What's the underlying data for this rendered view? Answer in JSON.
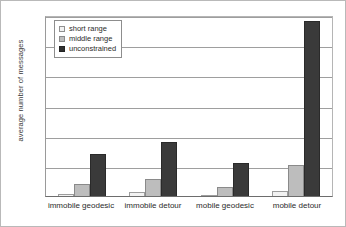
{
  "chart_data": {
    "type": "bar",
    "title": "",
    "xlabel": "",
    "ylabel": "average number of messages",
    "ylim": [
      0,
      3000
    ],
    "yticks": [
      "0",
      "500",
      "1000",
      "1500",
      "2000",
      "2500",
      "3000"
    ],
    "grid": true,
    "legend_position": "top-left",
    "categories": [
      "immobile geodesic",
      "immobile detour",
      "mobile geodesic",
      "mobile detour"
    ],
    "series": [
      {
        "name": "short range",
        "values": [
          30,
          60,
          20,
          80
        ]
      },
      {
        "name": "middle range",
        "values": [
          200,
          280,
          150,
          520
        ]
      },
      {
        "name": "unconstrained",
        "values": [
          700,
          900,
          540,
          2900
        ]
      }
    ],
    "colors": {
      "short range": "#f2f2f2",
      "middle range": "#bdbdbd",
      "unconstrained": "#3a3a3a",
      "gridline": "#9e9e9e",
      "axis": "#6d6d6d",
      "text": "#2b2b2b"
    }
  }
}
